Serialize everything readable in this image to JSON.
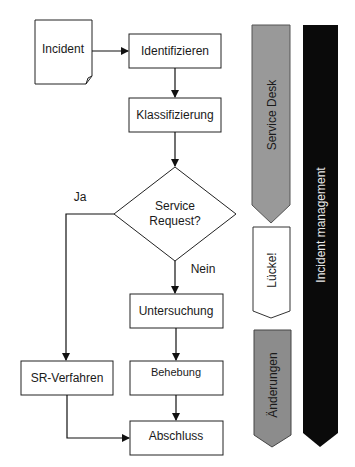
{
  "diagram": {
    "type": "flowchart",
    "nodes": {
      "incident": "Incident",
      "identifizieren": "Identifizieren",
      "klassifizierung": "Klassifizierung",
      "decision_line1": "Service",
      "decision_line2": "Request?",
      "untersuchung": "Untersuchung",
      "behebung": "Behebung",
      "sr_verfahren": "SR-Verfahren",
      "abschluss": "Abschluss"
    },
    "edge_labels": {
      "yes": "Ja",
      "no": "Nein"
    },
    "side_bars": {
      "service_desk": {
        "label": "Service Desk",
        "color": "#999999"
      },
      "luecke": {
        "label": "Lücke!",
        "color": "#ffffff"
      },
      "aenderungen": {
        "label": "Änderungen",
        "color": "#8c8c8c"
      },
      "incident_management": {
        "label": "Incident management",
        "color": "#0a0a0a"
      }
    }
  }
}
